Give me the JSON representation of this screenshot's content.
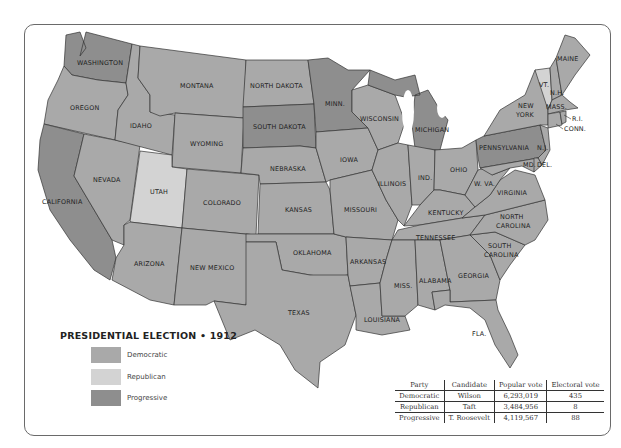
{
  "title": "PRESIDENTIAL ELECTION • 1912",
  "colors": {
    "democratic": "#a9a9a9",
    "republican": "#d3d3d3",
    "progressive": "#8e8e8e",
    "border": "#333333",
    "water": "#ffffff"
  },
  "legend": [
    {
      "party": "Democratic",
      "color": "#a9a9a9"
    },
    {
      "party": "Republican",
      "color": "#d3d3d3"
    },
    {
      "party": "Progressive",
      "color": "#8e8e8e"
    }
  ],
  "states": {
    "washington": {
      "label": "WASHINGTON",
      "party": "Progressive"
    },
    "oregon": {
      "label": "OREGON",
      "party": "Democratic"
    },
    "california": {
      "label": "CALIFORNIA",
      "party": "Progressive"
    },
    "idaho": {
      "label": "IDAHO",
      "party": "Democratic"
    },
    "nevada": {
      "label": "NEVADA",
      "party": "Democratic"
    },
    "montana": {
      "label": "MONTANA",
      "party": "Democratic"
    },
    "wyoming": {
      "label": "WYOMING",
      "party": "Democratic"
    },
    "utah": {
      "label": "UTAH",
      "party": "Republican"
    },
    "colorado": {
      "label": "COLORADO",
      "party": "Democratic"
    },
    "arizona": {
      "label": "ARIZONA",
      "party": "Democratic"
    },
    "new_mexico": {
      "label": "NEW MEXICO",
      "party": "Democratic"
    },
    "north_dakota": {
      "label": "NORTH DAKOTA",
      "party": "Democratic"
    },
    "south_dakota": {
      "label": "SOUTH DAKOTA",
      "party": "Progressive"
    },
    "nebraska": {
      "label": "NEBRASKA",
      "party": "Democratic"
    },
    "kansas": {
      "label": "KANSAS",
      "party": "Democratic"
    },
    "oklahoma": {
      "label": "OKLAHOMA",
      "party": "Democratic"
    },
    "texas": {
      "label": "TEXAS",
      "party": "Democratic"
    },
    "minnesota": {
      "label": "MINN.",
      "party": "Progressive"
    },
    "iowa": {
      "label": "IOWA",
      "party": "Democratic"
    },
    "missouri": {
      "label": "MISSOURI",
      "party": "Democratic"
    },
    "arkansas": {
      "label": "ARKANSAS",
      "party": "Democratic"
    },
    "louisiana": {
      "label": "LOUISIANA",
      "party": "Democratic"
    },
    "wisconsin": {
      "label": "WISCONSIN",
      "party": "Democratic"
    },
    "illinois": {
      "label": "ILLINOIS",
      "party": "Democratic"
    },
    "michigan": {
      "label": "MICHIGAN",
      "party": "Progressive"
    },
    "indiana": {
      "label": "IND.",
      "party": "Democratic"
    },
    "ohio": {
      "label": "OHIO",
      "party": "Democratic"
    },
    "kentucky": {
      "label": "KENTUCKY",
      "party": "Democratic"
    },
    "tennessee": {
      "label": "TENNESSEE",
      "party": "Democratic"
    },
    "mississippi": {
      "label": "MISS.",
      "party": "Democratic"
    },
    "alabama": {
      "label": "ALABAMA",
      "party": "Democratic"
    },
    "georgia": {
      "label": "GEORGIA",
      "party": "Democratic"
    },
    "florida": {
      "label": "FLA.",
      "party": "Democratic"
    },
    "south_carolina": {
      "label": "SOUTH CAROLINA",
      "party": "Democratic"
    },
    "north_carolina": {
      "label": "NORTH CAROLINA",
      "party": "Democratic"
    },
    "virginia": {
      "label": "VIRGINIA",
      "party": "Democratic"
    },
    "west_virginia": {
      "label": "W. VA.",
      "party": "Democratic"
    },
    "pennsylvania": {
      "label": "PENNSYLVANIA",
      "party": "Progressive"
    },
    "new_york": {
      "label": "NEW YORK",
      "party": "Democratic"
    },
    "vermont": {
      "label": "VT.",
      "party": "Republican"
    },
    "new_hampshire": {
      "label": "N.H.",
      "party": "Democratic"
    },
    "maine": {
      "label": "MAINE",
      "party": "Democratic"
    },
    "massachusetts": {
      "label": "MASS.",
      "party": "Democratic"
    },
    "rhode_island": {
      "label": "R.I.",
      "party": "Democratic"
    },
    "connecticut": {
      "label": "CONN.",
      "party": "Democratic"
    },
    "new_jersey": {
      "label": "N.J.",
      "party": "Democratic"
    },
    "maryland": {
      "label": "MD.",
      "party": "Democratic"
    },
    "delaware": {
      "label": "DEL.",
      "party": "Democratic"
    }
  },
  "results_table": {
    "headers": [
      "Party",
      "Candidate",
      "Popular vote",
      "Electoral vote"
    ],
    "rows": [
      [
        "Democratic",
        "Wilson",
        "6,293,019",
        "435"
      ],
      [
        "Republican",
        "Taft",
        "3,484,956",
        "8"
      ],
      [
        "Progressive",
        "T. Roosevelt",
        "4,119,567",
        "88"
      ]
    ]
  }
}
